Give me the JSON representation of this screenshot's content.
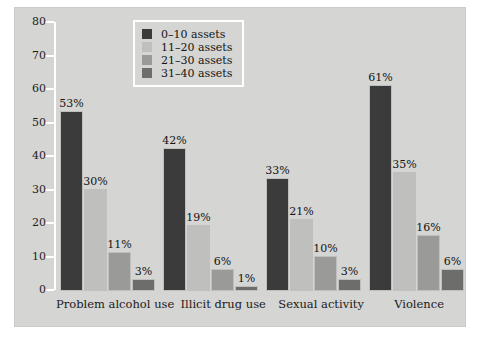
{
  "chart_data": {
    "type": "bar",
    "title": "",
    "subtitle": "",
    "xlabel": "",
    "ylabel": "",
    "ylim": [
      0,
      80
    ],
    "ytick_labels": [
      "80",
      "70",
      "60",
      "50",
      "40",
      "30",
      "20",
      "10",
      "0"
    ],
    "ytick_values": [
      80,
      70,
      60,
      50,
      40,
      30,
      20,
      10,
      0
    ],
    "grid": false,
    "legend_position": "top-center",
    "categories": [
      "Problem alcohol use",
      "Illicit drug use",
      "Sexual activity",
      "Violence"
    ],
    "series": [
      {
        "name": "0–10 assets",
        "color": "#3b3b3b",
        "values": [
          53,
          42,
          33,
          61
        ],
        "value_labels": [
          "53%",
          "42%",
          "33%",
          "61%"
        ]
      },
      {
        "name": "11–20 assets",
        "color": "#bfbfbd",
        "values": [
          30,
          19,
          21,
          35
        ],
        "value_labels": [
          "30%",
          "19%",
          "21%",
          "35%"
        ]
      },
      {
        "name": "21–30 assets",
        "color": "#9a9a98",
        "values": [
          11,
          6,
          10,
          16
        ],
        "value_labels": [
          "11%",
          "6%",
          "10%",
          "16%"
        ]
      },
      {
        "name": "31–40 assets",
        "color": "#6d6d6b",
        "values": [
          3,
          1,
          3,
          6
        ],
        "value_labels": [
          "3%",
          "1%",
          "3%",
          "6%"
        ]
      }
    ],
    "panel_color": "#d5d5d3",
    "axis_color": "#ffffff",
    "text_color": "#1a1a1a"
  }
}
